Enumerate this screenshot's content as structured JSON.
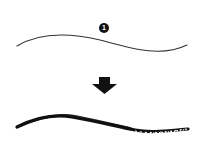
{
  "diagram": {
    "step_marker": {
      "label": "1",
      "icon": "numbered-circle-icon"
    },
    "arrow": {
      "icon": "arrow-down-icon",
      "direction": "down"
    },
    "top_stroke": {
      "description": "thin smooth curve",
      "color": "#333333"
    },
    "bottom_stroke": {
      "description": "textured brush stroke curve",
      "color": "#111111"
    }
  }
}
